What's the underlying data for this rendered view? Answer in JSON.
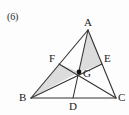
{
  "figure": {
    "item_number": "(6)",
    "width": 129,
    "height": 115,
    "colors": {
      "background": "#fdfdfd",
      "stroke": "#333333",
      "shade_fill": "#dcdcdc",
      "label_text": "#1b1b1b",
      "point_dot": "#111111"
    },
    "points": [
      {
        "name": "A",
        "x": 88,
        "y": 30,
        "label": "A",
        "label_x": 84,
        "label_y": 17
      },
      {
        "name": "B",
        "x": 31,
        "y": 98,
        "label": "B",
        "label_x": 19,
        "label_y": 92
      },
      {
        "name": "C",
        "x": 116,
        "y": 98,
        "label": "C",
        "label_x": 118,
        "label_y": 92
      },
      {
        "name": "D",
        "x": 73,
        "y": 98,
        "label": "D",
        "label_x": 69,
        "label_y": 101
      },
      {
        "name": "E",
        "x": 102,
        "y": 64,
        "label": "E",
        "label_x": 104,
        "label_y": 53
      },
      {
        "name": "F",
        "x": 59,
        "y": 64,
        "label": "F",
        "label_x": 49,
        "label_y": 53
      },
      {
        "name": "G",
        "x": 79,
        "y": 72,
        "label": "G",
        "label_x": 83,
        "label_y": 68
      }
    ],
    "segments": [
      {
        "name": "side-AB",
        "from": "A",
        "to": "B"
      },
      {
        "name": "side-BC",
        "from": "B",
        "to": "C"
      },
      {
        "name": "side-CA",
        "from": "C",
        "to": "A"
      },
      {
        "name": "cevian-AD",
        "from": "A",
        "to": "D"
      },
      {
        "name": "cevian-BE",
        "from": "B",
        "to": "E"
      },
      {
        "name": "cevian-CF",
        "from": "C",
        "to": "F"
      }
    ],
    "shaded_regions": [
      {
        "name": "triangle-BFG",
        "vertices": [
          "B",
          "F",
          "G"
        ]
      },
      {
        "name": "triangle-AGE",
        "vertices": [
          "A",
          "G",
          "E"
        ]
      }
    ]
  }
}
